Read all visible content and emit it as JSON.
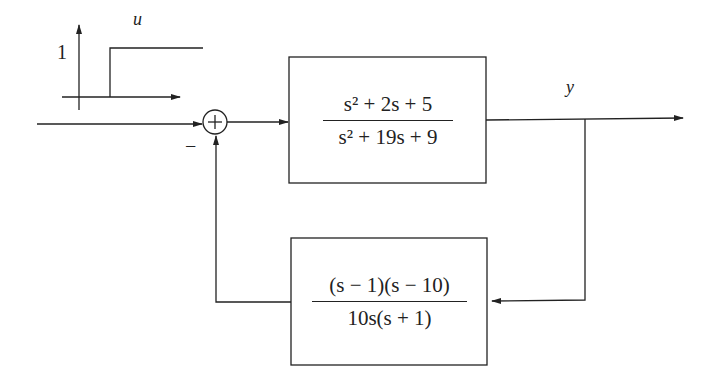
{
  "diagram": {
    "type": "feedback-block-diagram",
    "input": {
      "signal_label": "u",
      "step_plot": {
        "amplitude_label": "1",
        "type": "unit step"
      },
      "sum_sign_feedback": "−"
    },
    "output": {
      "signal_label": "y"
    },
    "forward_block": {
      "numerator": "s² + 2s + 5",
      "denominator": "s² + 19s + 9"
    },
    "feedback_block": {
      "numerator": "(s − 1)(s − 10)",
      "denominator": "10s(s + 1)"
    },
    "colors": {
      "line": "#222222",
      "background": "#ffffff"
    }
  }
}
